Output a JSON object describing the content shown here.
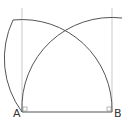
{
  "diagram": {
    "type": "geometric-construction",
    "points": {
      "A": {
        "label": "A",
        "x": 22,
        "y": 112
      },
      "B": {
        "label": "B",
        "x": 112,
        "y": 112
      }
    },
    "segment": "AB",
    "radius": 90,
    "colors": {
      "line": "#555555",
      "guide": "#bbbbbb",
      "background": "#ffffff"
    }
  }
}
